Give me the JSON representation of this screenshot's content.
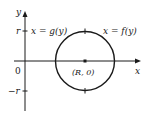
{
  "diagram": {
    "type": "coordinate-plot",
    "axes": {
      "x_label": "x",
      "y_label": "y",
      "origin_label": "0",
      "y_ticks": [
        {
          "label": "r",
          "value": "r"
        },
        {
          "label": "−r",
          "value": "-r"
        }
      ]
    },
    "circle": {
      "center_label": "(R, 0)",
      "center": "(R, 0)",
      "radius": "r"
    },
    "curves": [
      {
        "name": "left-half",
        "label": "x = g(y)"
      },
      {
        "name": "right-half",
        "label": "x = f(y)"
      }
    ],
    "colors": {
      "stroke": "#1a1a1a",
      "background": "#ffffff"
    }
  }
}
